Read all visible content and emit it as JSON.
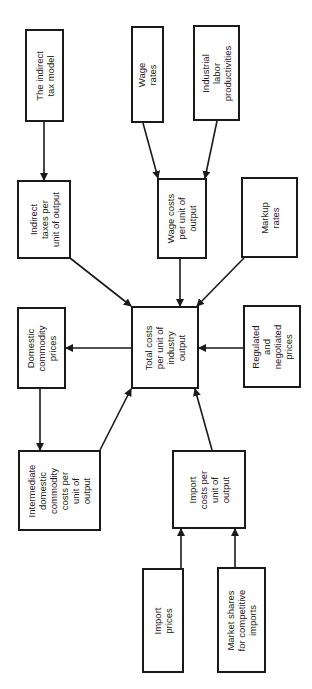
{
  "diagram": {
    "type": "flow-diagram",
    "orientation": "rotated-90-ccw",
    "colors": {
      "line": "#1a1a1a",
      "background": "#ffffff"
    },
    "nodes": [
      {
        "id": "indirect_tax_model",
        "label": "The indirect\ntax model",
        "x": 25,
        "y": 29,
        "w": 39,
        "h": 93
      },
      {
        "id": "indirect_taxes",
        "label": "Indirect\ntaxes per\nunit of output",
        "x": 17,
        "y": 180,
        "w": 54,
        "h": 79
      },
      {
        "id": "wage_rates",
        "label": "Wage\nrates",
        "x": 131,
        "y": 26,
        "w": 33,
        "h": 97
      },
      {
        "id": "labor_productivities",
        "label": "Industrial\nlabor\nproductivities",
        "x": 193,
        "y": 25,
        "w": 47,
        "h": 96
      },
      {
        "id": "wage_costs",
        "label": "Wage costs\nper unit of\noutput",
        "x": 157,
        "y": 178,
        "w": 50,
        "h": 81
      },
      {
        "id": "markup_rates",
        "label": "Markup\nrates",
        "x": 241,
        "y": 177,
        "w": 57,
        "h": 81
      },
      {
        "id": "domestic_prices",
        "label": "Domestic\ncommodity\nprices",
        "x": 17,
        "y": 307,
        "w": 49,
        "h": 82
      },
      {
        "id": "total_costs",
        "label": "Total costs\nper unit of\nindustry\noutput",
        "x": 131,
        "y": 306,
        "w": 68,
        "h": 83
      },
      {
        "id": "regulated_prices",
        "label": "Regulated\nand\nnegotiated\nprices",
        "x": 243,
        "y": 305,
        "w": 58,
        "h": 83
      },
      {
        "id": "intermediate_costs",
        "label": "Intermediate\ndomestic\ncommodity\ncosts per\nunit of\noutput",
        "x": 18,
        "y": 450,
        "w": 83,
        "h": 81
      },
      {
        "id": "import_costs",
        "label": "Import\ncosts per\nunit of\noutput",
        "x": 172,
        "y": 450,
        "w": 74,
        "h": 79
      },
      {
        "id": "import_prices",
        "label": "Import\nprices",
        "x": 142,
        "y": 568,
        "w": 42,
        "h": 105
      },
      {
        "id": "market_shares",
        "label": "Market shares\nfor competitive\nimports",
        "x": 217,
        "y": 567,
        "w": 49,
        "h": 106
      }
    ],
    "edges": [
      {
        "from": "indirect_tax_model",
        "to": "indirect_taxes",
        "x1": 44,
        "y1": 122,
        "x2": 44,
        "y2": 180
      },
      {
        "from": "wage_rates",
        "to": "wage_costs",
        "x1": 143,
        "y1": 123,
        "x2": 158,
        "y2": 178
      },
      {
        "from": "labor_productivities",
        "to": "wage_costs",
        "x1": 217,
        "y1": 121,
        "x2": 205,
        "y2": 178
      },
      {
        "from": "indirect_taxes",
        "to": "total_costs",
        "x1": 70,
        "y1": 258,
        "x2": 131,
        "y2": 306
      },
      {
        "from": "wage_costs",
        "to": "total_costs",
        "x1": 180,
        "y1": 259,
        "x2": 180,
        "y2": 306
      },
      {
        "from": "markup_rates",
        "to": "total_costs",
        "x1": 244,
        "y1": 258,
        "x2": 197,
        "y2": 306
      },
      {
        "from": "total_costs",
        "to": "domestic_prices",
        "x1": 131,
        "y1": 348,
        "x2": 66,
        "y2": 348
      },
      {
        "from": "regulated_prices",
        "to": "total_costs",
        "x1": 243,
        "y1": 348,
        "x2": 199,
        "y2": 348
      },
      {
        "from": "domestic_prices",
        "to": "intermediate_costs",
        "x1": 40,
        "y1": 389,
        "x2": 40,
        "y2": 450
      },
      {
        "from": "intermediate_costs",
        "to": "total_costs",
        "x1": 100,
        "y1": 450,
        "x2": 131,
        "y2": 389
      },
      {
        "from": "import_costs",
        "to": "total_costs",
        "x1": 212,
        "y1": 450,
        "x2": 195,
        "y2": 389
      },
      {
        "from": "import_prices",
        "to": "import_costs",
        "x1": 181,
        "y1": 568,
        "x2": 181,
        "y2": 529
      },
      {
        "from": "market_shares",
        "to": "import_costs",
        "x1": 235,
        "y1": 567,
        "x2": 235,
        "y2": 529
      }
    ]
  }
}
